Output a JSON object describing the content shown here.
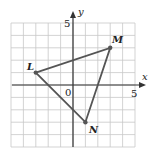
{
  "figure": {
    "axes": {
      "x_label": "x",
      "y_label": "y",
      "x_tick_label": "5",
      "y_tick_label": "5",
      "origin_label": "0",
      "x_range": [
        -5,
        5
      ],
      "y_range": [
        -5,
        5
      ],
      "grid": true
    },
    "triangle": {
      "vertices": [
        {
          "name": "L",
          "x": -3,
          "y": 1
        },
        {
          "name": "M",
          "x": 3,
          "y": 3
        },
        {
          "name": "N",
          "x": 1,
          "y": -3
        }
      ]
    },
    "colors": {
      "grid": "#c8c8c8",
      "axis": "#333333",
      "triangle": "#555555",
      "text": "#222222"
    }
  }
}
